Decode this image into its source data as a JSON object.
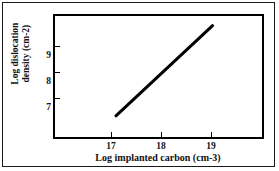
{
  "figure": {
    "border_color": "#1a1a1a",
    "background": "#ffffff"
  },
  "chart_data": {
    "type": "line",
    "title": "",
    "subtitle": "",
    "xlabel": "Log implanted carbon (cm-3)",
    "ylabel_line1": "Log dislocation",
    "ylabel_line2": "density (cm-2)",
    "ylabel": "Log dislocation density (cm-2)",
    "xlim": [
      16.3,
      19.9
    ],
    "ylim": [
      6.1,
      10.1
    ],
    "xticks": [
      17,
      18,
      19
    ],
    "xtick_labels": [
      "17",
      "18",
      "19"
    ],
    "yticks": [
      7,
      8,
      9
    ],
    "ytick_labels": [
      "7",
      "8",
      "9"
    ],
    "grid": false,
    "legend": null,
    "series": [
      {
        "name": "dislocation density trend",
        "color": "#000000",
        "linewidth": 3,
        "x": [
          17.36,
          19.04
        ],
        "y": [
          6.8,
          9.78
        ],
        "points": [
          {
            "x": 17.36,
            "y": 6.8
          },
          {
            "x": 19.04,
            "y": 9.78
          }
        ]
      }
    ]
  }
}
